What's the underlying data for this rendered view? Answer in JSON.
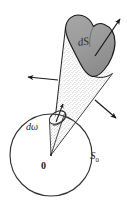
{
  "figure": {
    "kind": "solid-angle-cone-diagram",
    "width": 127,
    "height": 213,
    "background_color": "#ffffff",
    "ink_color": "#1a1a1a",
    "cap_fill_color": "#9a9a9a",
    "cap_stroke_color": "#1a1a1a",
    "cone_stipple_color": "#767676",
    "sphere_stroke_color": "#333333"
  },
  "labels": {
    "surface_element": "dS",
    "solid_angle": "dω",
    "sphere": "S",
    "sphere_subscript": "0",
    "origin": "0"
  },
  "elements": {
    "sphere_circle": {
      "name": "unit-sphere-cross-section",
      "center_x": 51,
      "center_y": 155,
      "radius": 41
    },
    "origin_point": {
      "name": "origin",
      "x": 51,
      "y": 155
    },
    "cone": {
      "name": "solid-angle-cone",
      "apex_x": 51,
      "apex_y": 155
    },
    "arrows": [
      {
        "name": "normal-arrow-left",
        "direction": "left"
      },
      {
        "name": "normal-arrow-upper-right",
        "direction": "upper-right"
      },
      {
        "name": "normal-arrow-lower-right",
        "direction": "lower-right"
      },
      {
        "name": "normal-arrow-small-inner",
        "direction": "up"
      }
    ]
  }
}
